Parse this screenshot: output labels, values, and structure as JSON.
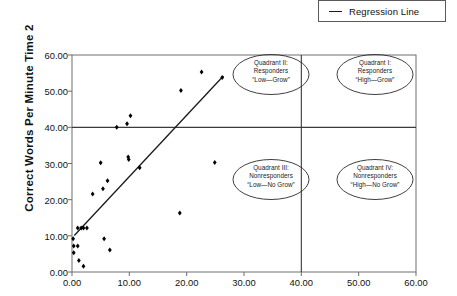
{
  "legend": {
    "entries": [
      {
        "label": "Regression Line",
        "marker": "line",
        "color": "#1a1a1a"
      }
    ]
  },
  "axes": {
    "ylabel": "Correct Words Per Minute Time 2",
    "xlabel": "",
    "yticks": [
      "0.00",
      "10.00",
      "20.00",
      "30.00",
      "40.00",
      "50.00",
      "60.00"
    ],
    "xticks": [
      "0.00",
      "10.00",
      "20.00",
      "30.00",
      "40.00",
      "50.00",
      "60.00"
    ]
  },
  "annotations": [
    {
      "name": "quadrant-2",
      "line1": "Quadrant II:",
      "line2": "Responders",
      "line3": "“Low—Grow”"
    },
    {
      "name": "quadrant-1",
      "line1": "Quadrant I:",
      "line2": "Responders",
      "line3": "“High—Grow”"
    },
    {
      "name": "quadrant-3",
      "line1": "Quadrant III:",
      "line2": "Nonresponders",
      "line3": "“Low—No Grow”"
    },
    {
      "name": "quadrant-4",
      "line1": "Quadrant IV:",
      "line2": "Nonresponders",
      "line3": "“High—No Grow”"
    }
  ],
  "chart_data": {
    "type": "scatter",
    "title": "",
    "xlabel": "",
    "ylabel": "Correct Words Per Minute Time 2",
    "xlim": [
      0,
      60
    ],
    "ylim": [
      0,
      60
    ],
    "xticks": [
      0,
      10,
      20,
      30,
      40,
      50,
      60
    ],
    "yticks": [
      0,
      10,
      20,
      30,
      40,
      50,
      60
    ],
    "grid": false,
    "legend_position": "top-right-outside",
    "marker": "filled-diamond",
    "marker_color": "#000000",
    "series": [
      {
        "name": "Students",
        "type": "scatter",
        "points": [
          [
            0.2,
            9.2
          ],
          [
            0.3,
            7.2
          ],
          [
            0.3,
            5.3
          ],
          [
            1.0,
            12.2
          ],
          [
            1.0,
            7.2
          ],
          [
            1.2,
            3.2
          ],
          [
            1.6,
            12.2
          ],
          [
            2.0,
            12.2
          ],
          [
            2.0,
            1.6
          ],
          [
            2.6,
            12.2
          ],
          [
            3.6,
            21.6
          ],
          [
            5.0,
            30.2
          ],
          [
            5.4,
            23.0
          ],
          [
            5.6,
            9.2
          ],
          [
            6.2,
            25.2
          ],
          [
            6.6,
            6.1
          ],
          [
            7.8,
            40.0
          ],
          [
            9.6,
            41.0
          ],
          [
            9.8,
            31.8
          ],
          [
            9.9,
            31.1
          ],
          [
            10.2,
            43.2
          ],
          [
            11.8,
            28.8
          ],
          [
            18.8,
            16.3
          ],
          [
            19.0,
            50.2
          ],
          [
            22.6,
            55.3
          ],
          [
            24.9,
            30.3
          ],
          [
            26.2,
            53.8
          ]
        ]
      },
      {
        "name": "Regression Line",
        "type": "line",
        "points": [
          [
            0.4,
            10.1
          ],
          [
            26.4,
            54.2
          ]
        ],
        "color": "#1a1a1a"
      }
    ],
    "reference_lines": [
      {
        "name": "vertical-quadrant-divider",
        "orientation": "vertical",
        "value": 40
      },
      {
        "name": "horizontal-quadrant-divider",
        "orientation": "horizontal",
        "value": 40
      }
    ],
    "annotations": [
      {
        "text": "Quadrant II: Responders “Low—Grow”",
        "x": 33,
        "y": 50
      },
      {
        "text": "Quadrant I: Responders “High—Grow”",
        "x": 51,
        "y": 50
      },
      {
        "text": "Quadrant III: Nonresponders “Low—No Grow”",
        "x": 33,
        "y": 21
      },
      {
        "text": "Quadrant IV: Nonresponders “High—No Grow”",
        "x": 51,
        "y": 21
      }
    ]
  }
}
